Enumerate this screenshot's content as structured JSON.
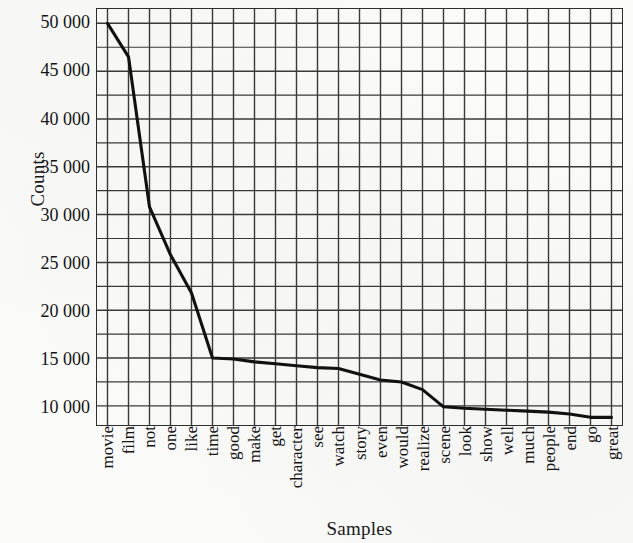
{
  "chart_data": {
    "type": "line",
    "title": "",
    "xlabel": "Samples",
    "ylabel": "Counts",
    "grid": true,
    "legend": null,
    "ylim": [
      8000,
      51500
    ],
    "ytick_labels": [
      "50 000",
      "45 000",
      "40 000",
      "35 000",
      "30 000",
      "25 000",
      "20 000",
      "15 000",
      "10 000"
    ],
    "ytick_values": [
      50000,
      45000,
      40000,
      35000,
      30000,
      25000,
      20000,
      15000,
      10000
    ],
    "minor_grid_step": 2500,
    "categories": [
      "movie",
      "film",
      "not",
      "one",
      "like",
      "time",
      "good",
      "make",
      "get",
      "character",
      "see",
      "watch",
      "story",
      "even",
      "would",
      "realize",
      "scene",
      "look",
      "show",
      "well",
      "much",
      "people",
      "end",
      "go",
      "great"
    ],
    "values": [
      50000,
      46500,
      30800,
      25800,
      21800,
      15000,
      14900,
      14600,
      14400,
      14200,
      14000,
      13900,
      13300,
      12700,
      12500,
      11700,
      9900,
      9750,
      9650,
      9550,
      9450,
      9350,
      9150,
      8800,
      8800
    ],
    "line_color": "#111111",
    "grid_color": "#3a3a3a"
  }
}
